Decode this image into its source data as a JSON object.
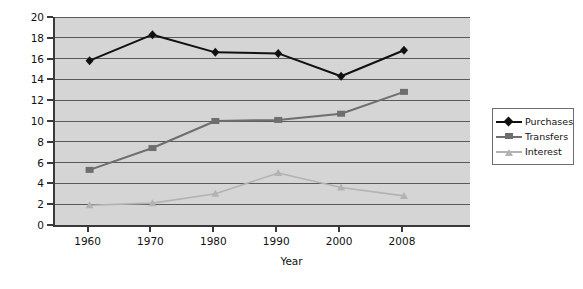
{
  "chart_data": {
    "type": "line",
    "title": "",
    "subtitle": "",
    "xlabel": "Year",
    "ylabel": "Percent",
    "categories": [
      "1960",
      "1970",
      "1980",
      "1990",
      "2000",
      "2008"
    ],
    "xlim": [
      0,
      5
    ],
    "ylim": [
      0,
      20
    ],
    "yticks": [
      0,
      2,
      4,
      6,
      8,
      10,
      12,
      14,
      16,
      18,
      20
    ],
    "ytick_labels": [
      "0",
      "2",
      "4",
      "6",
      "8",
      "10",
      "12",
      "14",
      "16",
      "18",
      "20"
    ],
    "grid": "horizontal",
    "legend_position": "right",
    "plot_background": "#d5d5d5",
    "figure_background": "#ffffff",
    "series": [
      {
        "name": "Purchases",
        "color": "#111111",
        "marker": "diamond",
        "values": [
          15.8,
          18.3,
          16.6,
          16.5,
          14.3,
          16.8
        ]
      },
      {
        "name": "Transfers",
        "color": "#6e6e6e",
        "marker": "square",
        "values": [
          5.3,
          7.4,
          10.0,
          10.1,
          10.7,
          12.8
        ]
      },
      {
        "name": "Interest",
        "color": "#b3b3b3",
        "marker": "triangle",
        "values": [
          1.9,
          2.1,
          3.0,
          5.0,
          3.6,
          2.8
        ]
      }
    ]
  }
}
